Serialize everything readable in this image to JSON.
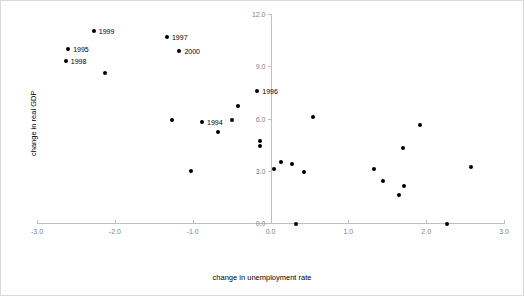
{
  "chart_data": {
    "type": "scatter",
    "title": "",
    "xlabel": "change in unemployment rate",
    "ylabel": "change in real GDP",
    "xlim": [
      -3.0,
      3.0
    ],
    "ylim": [
      0.0,
      12.0
    ],
    "xticks": [
      "-3.0",
      "-2.0",
      "-1.0",
      "0.0",
      "1.0",
      "2.0",
      "3.0"
    ],
    "xtick_values": [
      -3.0,
      -2.0,
      -1.0,
      0.0,
      1.0,
      2.0,
      3.0
    ],
    "yticks": [
      "0.0",
      "3.0",
      "6.0",
      "9.0",
      "12.0"
    ],
    "ytick_values": [
      0.0,
      3.0,
      6.0,
      9.0,
      12.0
    ],
    "grid": false,
    "legend": false,
    "points": [
      {
        "x": -2.27,
        "y": 11.0,
        "label": "1999"
      },
      {
        "x": -1.33,
        "y": 10.7,
        "label": "1997"
      },
      {
        "x": -1.17,
        "y": 9.9,
        "label": "2000"
      },
      {
        "x": -2.6,
        "y": 10.0,
        "label": "1995"
      },
      {
        "x": -2.63,
        "y": 9.3,
        "label": "1998"
      },
      {
        "x": -2.13,
        "y": 8.6,
        "label": ""
      },
      {
        "x": -0.17,
        "y": 7.6,
        "label": "1996"
      },
      {
        "x": -0.42,
        "y": 6.7,
        "label": ""
      },
      {
        "x": -1.27,
        "y": 5.9,
        "label": ""
      },
      {
        "x": -0.88,
        "y": 5.8,
        "label": "1994"
      },
      {
        "x": -0.5,
        "y": 5.9,
        "label": ""
      },
      {
        "x": -0.67,
        "y": 5.2,
        "label": ""
      },
      {
        "x": -0.13,
        "y": 4.7,
        "label": ""
      },
      {
        "x": -0.13,
        "y": 4.4,
        "label": ""
      },
      {
        "x": -1.02,
        "y": 3.0,
        "label": ""
      },
      {
        "x": 0.13,
        "y": 3.5,
        "label": ""
      },
      {
        "x": 0.05,
        "y": 3.1,
        "label": ""
      },
      {
        "x": 0.27,
        "y": 3.4,
        "label": ""
      },
      {
        "x": 0.55,
        "y": 6.1,
        "label": ""
      },
      {
        "x": 0.43,
        "y": 2.9,
        "label": ""
      },
      {
        "x": 1.33,
        "y": 3.1,
        "label": ""
      },
      {
        "x": 1.45,
        "y": 2.4,
        "label": ""
      },
      {
        "x": 1.72,
        "y": 2.1,
        "label": ""
      },
      {
        "x": 1.65,
        "y": 1.6,
        "label": ""
      },
      {
        "x": 1.7,
        "y": 4.3,
        "label": ""
      },
      {
        "x": 1.92,
        "y": 5.6,
        "label": ""
      },
      {
        "x": 2.58,
        "y": 3.2,
        "label": ""
      },
      {
        "x": 0.33,
        "y": -0.05,
        "label": ""
      },
      {
        "x": 2.27,
        "y": -0.05,
        "label": ""
      }
    ]
  }
}
